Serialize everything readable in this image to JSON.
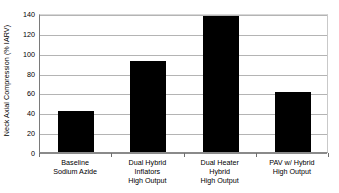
{
  "chart_data": {
    "type": "bar",
    "title": "",
    "xlabel": "",
    "ylabel": "Neck Axial Compression (% IARV)",
    "ylim": [
      0,
      140
    ],
    "ytick_values": [
      0,
      20,
      40,
      60,
      80,
      100,
      120,
      140
    ],
    "ytick_labels": [
      "0",
      "20",
      "40",
      "60",
      "80",
      "100",
      "120",
      "140"
    ],
    "grid": "horizontal",
    "legend": "none",
    "bar_color": "#000000",
    "categories": [
      "Baseline Sodium Azide",
      "Dual Hybrid Inflators High Output",
      "Dual Heater Hybrid High Output",
      "PAV w/ Hybrid High Output"
    ],
    "category_lines": [
      [
        "Baseline",
        "Sodium Azide"
      ],
      [
        "Dual Hybrid",
        "Inflators",
        "High Output"
      ],
      [
        "Dual Heater",
        "Hybrid",
        "High Output"
      ],
      [
        "PAV w/ Hybrid",
        "High Output"
      ]
    ],
    "values": [
      41.5,
      91.5,
      136.5,
      60.0
    ]
  }
}
